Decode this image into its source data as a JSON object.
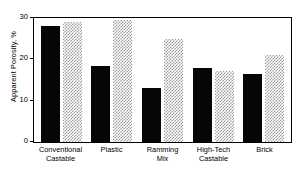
{
  "chart_data": {
    "type": "bar",
    "title": "",
    "xlabel": "",
    "ylabel": "Apparent Porosity, %",
    "ylim": [
      0,
      30
    ],
    "yticks": [
      "0",
      "10",
      "20",
      "30"
    ],
    "grid": false,
    "legend_position": "none",
    "categories": [
      "Conventional Castable",
      "Plastic",
      "Ramming Mix",
      "High-Tech Castable",
      "Brick"
    ],
    "category_lines": [
      [
        "Conventional",
        "Castable"
      ],
      [
        "Plastic",
        ""
      ],
      [
        "Ramming",
        "Mix"
      ],
      [
        "High-Tech",
        "Castable"
      ],
      [
        "Brick",
        ""
      ]
    ],
    "series": [
      {
        "name": "solid-black-series",
        "color": "#060606",
        "values": [
          28,
          18.3,
          13,
          17.8,
          16.5
        ]
      },
      {
        "name": "checkered-gray-series",
        "color": "#9a9a9a",
        "values": [
          29,
          29.5,
          25,
          17.3,
          21
        ]
      }
    ]
  }
}
